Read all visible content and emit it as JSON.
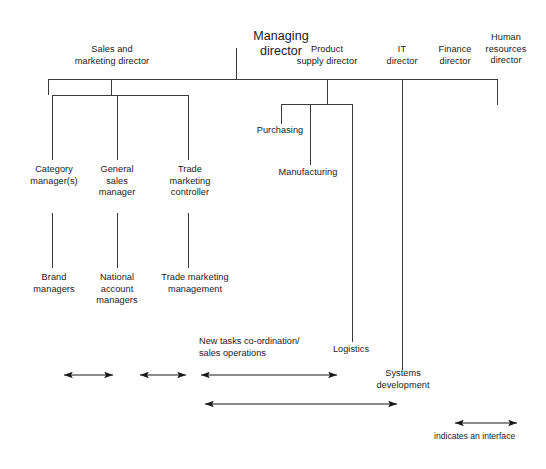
{
  "diagram": {
    "title_node": {
      "id": "managing-director",
      "label": "Managing\ndirector",
      "x": 236,
      "y": 14,
      "w": 90
    },
    "directors": [
      {
        "id": "sales-and-marketing-director",
        "label": "Sales and\nmarketing director",
        "x": 56,
        "y": 44,
        "w": 112
      },
      {
        "id": "product-supply-director",
        "label": "Product\nsupply director",
        "x": 279,
        "y": 44,
        "w": 96
      },
      {
        "id": "it-director",
        "label": "IT\ndirector",
        "x": 376,
        "y": 44,
        "w": 52
      },
      {
        "id": "finance-director",
        "label": "Finance\ndirector",
        "x": 427,
        "y": 44,
        "w": 56
      },
      {
        "id": "human-resources-director",
        "label": "Human\nresources\ndirector",
        "x": 473,
        "y": 32,
        "w": 66
      }
    ],
    "sales_children": [
      {
        "id": "category-managers",
        "label": "Category\nmanager(s)",
        "x": 14,
        "y": 164,
        "w": 80
      },
      {
        "id": "general-sales-manager",
        "label": "General\nsales\nmanager",
        "x": 82,
        "y": 164,
        "w": 70
      },
      {
        "id": "trade-marketing-controller",
        "label": "Trade\nmarketing\ncontroller",
        "x": 152,
        "y": 164,
        "w": 76
      }
    ],
    "sales_grandchildren": [
      {
        "id": "brand-managers",
        "label": "Brand\nmanagers",
        "x": 17,
        "y": 272,
        "w": 74
      },
      {
        "id": "national-account-managers",
        "label": "National\naccount\nmanagers",
        "x": 83,
        "y": 272,
        "w": 68
      },
      {
        "id": "trade-marketing-management",
        "label": "Trade marketing\nmanagement",
        "x": 146,
        "y": 272,
        "w": 98
      }
    ],
    "supply_children": [
      {
        "id": "purchasing",
        "label": "Purchasing",
        "x": 251,
        "y": 125,
        "w": 58
      },
      {
        "id": "manufacturing",
        "label": "Manufacturing",
        "x": 272,
        "y": 167,
        "w": 72
      },
      {
        "id": "logistics",
        "label": "Logistics",
        "x": 325,
        "y": 344,
        "w": 52
      }
    ],
    "it_children": [
      {
        "id": "systems-development",
        "label": "Systems\ndevelopment",
        "x": 366,
        "y": 368,
        "w": 74
      }
    ],
    "annotation": {
      "id": "new-tasks-annotation",
      "label": "New tasks co-ordination/\nsales operations",
      "x": 199,
      "y": 336
    },
    "legend": {
      "id": "interface-legend",
      "label": "indicates an interface",
      "x": 434,
      "y": 431,
      "arrow": {
        "x1": 455,
        "x2": 517,
        "y": 423
      }
    },
    "interface_arrows": [
      {
        "id": "interface-arrow-1",
        "x1": 64,
        "x2": 113,
        "y": 375
      },
      {
        "id": "interface-arrow-2",
        "x1": 140,
        "x2": 186,
        "y": 375
      },
      {
        "id": "interface-arrow-3",
        "x1": 201,
        "x2": 337,
        "y": 375
      },
      {
        "id": "interface-arrow-4",
        "x1": 205,
        "x2": 397,
        "y": 404
      }
    ],
    "connectors": {
      "md_stem": {
        "x": 236,
        "y1": 48,
        "y2": 79
      },
      "main_bus": {
        "x1": 48,
        "x2": 497,
        "y": 79
      },
      "drops_from_bus": [
        {
          "id": "drop-sales",
          "x": 111,
          "y1": 79,
          "y2": 95
        },
        {
          "id": "drop-supply",
          "x": 327,
          "y1": 79,
          "y2": 104
        },
        {
          "id": "drop-it",
          "x": 402,
          "y1": 79,
          "y2": 370
        },
        {
          "id": "drop-hr",
          "x": 497,
          "y1": 79,
          "y2": 105
        },
        {
          "id": "drop-left-end",
          "x": 48,
          "y1": 79,
          "y2": 95
        }
      ],
      "sales_bus": {
        "x1": 52,
        "x2": 188,
        "y": 95
      },
      "sales_drops": [
        {
          "id": "drop-category",
          "x": 52,
          "y1": 95,
          "y2": 160
        },
        {
          "id": "drop-general-sales",
          "x": 117,
          "y1": 95,
          "y2": 160
        },
        {
          "id": "drop-trade-marketing",
          "x": 188,
          "y1": 95,
          "y2": 160
        }
      ],
      "sales_second_drops": [
        {
          "id": "drop-brand",
          "x": 52,
          "y1": 213,
          "y2": 268
        },
        {
          "id": "drop-national-account",
          "x": 117,
          "y1": 213,
          "y2": 268
        },
        {
          "id": "drop-trade-mgmt",
          "x": 188,
          "y1": 213,
          "y2": 268
        }
      ],
      "supply_bus": {
        "x1": 281,
        "x2": 352,
        "y": 104
      },
      "supply_drops": [
        {
          "id": "drop-purchasing",
          "x": 281,
          "y1": 104,
          "y2": 124
        },
        {
          "id": "drop-manufacturing",
          "x": 310,
          "y1": 104,
          "y2": 165
        },
        {
          "id": "drop-logistics",
          "x": 352,
          "y1": 104,
          "y2": 342
        }
      ]
    }
  },
  "style": {
    "line_color": "#3a3a3a",
    "arrow_color": "#1a1a1a",
    "background": "#ffffff"
  }
}
